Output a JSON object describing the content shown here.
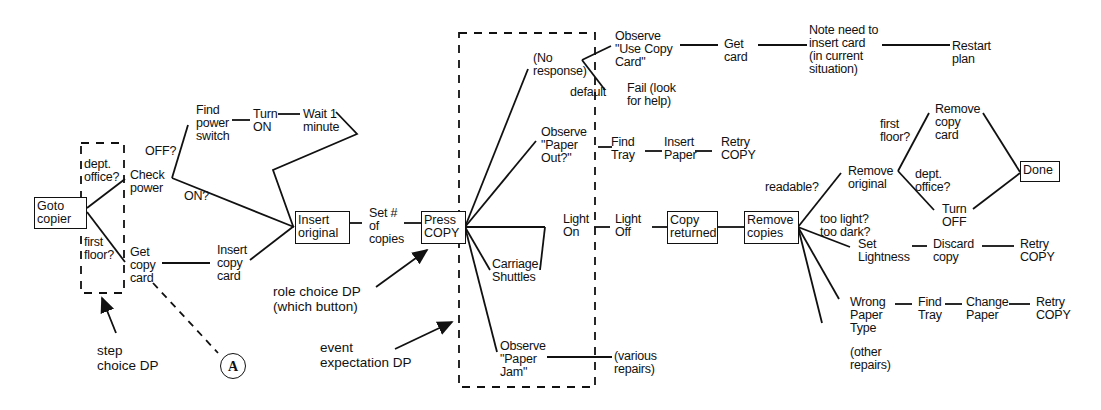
{
  "diagram": {
    "type": "task-decision-tree",
    "nodes": {
      "goto_copier": "Goto\ncopier",
      "dept_office_q": "dept.\noffice?",
      "first_floor_q": "first\nfloor?",
      "check_power": "Check\npower",
      "get_copy_card": "Get\ncopy\ncard",
      "off_q": "OFF?",
      "on_q": "ON?",
      "find_power_switch": "Find\npower\nswitch",
      "turn_on": "Turn\nON",
      "wait_1_minute": "Wait 1\nminute",
      "insert_copy_card": "Insert\ncopy\ncard",
      "insert_original": "Insert\noriginal",
      "set_copies": "Set #\nof\ncopies",
      "press_copy": "Press\nCOPY",
      "no_response": "(No\nresponse)",
      "default": "default",
      "observe_use_copy_card": "Observe\n\"Use Copy\nCard\"",
      "fail_look_help": "Fail (look\nfor help)",
      "get_card": "Get\ncard",
      "note_insert_card": "Note need to\ninsert card\n(in current\nsituation)",
      "restart_plan": "Restart\nplan",
      "observe_paper_out": "Observe\n\"Paper\nOut?\"",
      "find_tray_1": "Find\nTray",
      "insert_paper": "Insert\nPaper",
      "retry_copy_1": "Retry\nCOPY",
      "light_on": "Light\nOn",
      "light_off": "Light\nOff",
      "copy_returned": "Copy\nreturned",
      "carriage_shuttles": "Carriage\nShuttles",
      "observe_paper_jam": "Observe\n\"Paper\nJam\"",
      "various_repairs": "(various\nrepairs)",
      "remove_copies": "Remove\ncopies",
      "readable_q": "readable?",
      "remove_original": "Remove\noriginal",
      "first_floor_q2": "first\nfloor?",
      "dept_office_q2": "dept.\noffice?",
      "remove_copy_card": "Remove\ncopy\ncard",
      "turn_off": "Turn\nOFF",
      "done": "Done",
      "too_light_dark_q": "too light?\ntoo dark?",
      "set_lightness": "Set\nLightness",
      "discard_copy": "Discard\ncopy",
      "retry_copy_2": "Retry\nCOPY",
      "wrong_paper_type": "Wrong\nPaper\nType",
      "find_tray_2": "Find\nTray",
      "change_paper": "Change\nPaper",
      "retry_copy_3": "Retry\nCOPY",
      "other_repairs": "(other\nrepairs)"
    },
    "annotations": {
      "step_choice": "step\nchoice DP",
      "role_choice": "role choice DP\n(which button)",
      "event_expectation": "event\nexpectation DP",
      "connector_a": "A"
    },
    "colors": {
      "ink": "#111111",
      "background": "#ffffff"
    }
  }
}
